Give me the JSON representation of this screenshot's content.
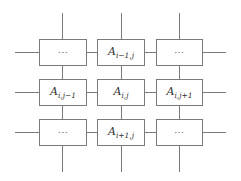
{
  "diagram": {
    "type": "grid-neighborhood",
    "line_color": "#7a7a7a",
    "columns_x": [
      39,
      97,
      156
    ],
    "rows_y": [
      39,
      79,
      119
    ],
    "cells": [
      {
        "row": 0,
        "col": 0,
        "kind": "ellipsis",
        "text": "⋯"
      },
      {
        "row": 0,
        "col": 1,
        "kind": "label",
        "base": "A",
        "sub": "i−1,j"
      },
      {
        "row": 0,
        "col": 2,
        "kind": "ellipsis",
        "text": "⋯"
      },
      {
        "row": 1,
        "col": 0,
        "kind": "label",
        "base": "A",
        "sub": "i,j−1"
      },
      {
        "row": 1,
        "col": 1,
        "kind": "label",
        "base": "A",
        "sub": "i,j"
      },
      {
        "row": 1,
        "col": 2,
        "kind": "label",
        "base": "A",
        "sub": "i,j+1"
      },
      {
        "row": 2,
        "col": 0,
        "kind": "ellipsis",
        "text": "⋯"
      },
      {
        "row": 2,
        "col": 1,
        "kind": "label",
        "base": "A",
        "sub": "i+1,j"
      },
      {
        "row": 2,
        "col": 2,
        "kind": "ellipsis",
        "text": "⋯"
      }
    ]
  }
}
